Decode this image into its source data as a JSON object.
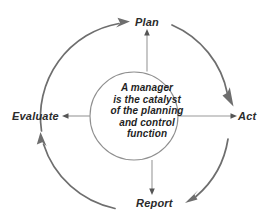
{
  "diagram": {
    "background_color": "#ffffff",
    "arc_color": "#6e6e6e",
    "spoke_color": "#9a9a9a",
    "label_color": "#2b2b2b",
    "center": {
      "lines": [
        "A manager",
        "is the catalyst",
        "of the planning",
        "and control",
        "function"
      ],
      "full_text": "A manager is the catalyst of the planning and control function"
    },
    "nodes": [
      {
        "id": "plan",
        "label": "Plan",
        "position": "top"
      },
      {
        "id": "act",
        "label": "Act",
        "position": "right"
      },
      {
        "id": "report",
        "label": "Report",
        "position": "bottom"
      },
      {
        "id": "evaluate",
        "label": "Evaluate",
        "position": "left"
      }
    ],
    "flow_order": [
      "Plan",
      "Act",
      "Report",
      "Evaluate"
    ],
    "arcs": [
      {
        "id": "arc-plan-to-act",
        "from": "Plan",
        "to": "Act",
        "direction": "clockwise"
      },
      {
        "id": "arc-act-to-report",
        "from": "Act",
        "to": "Report",
        "direction": "clockwise"
      },
      {
        "id": "arc-report-to-evaluate",
        "from": "Report",
        "to": "Evaluate",
        "direction": "clockwise"
      },
      {
        "id": "arc-evaluate-to-plan",
        "from": "Evaluate",
        "to": "Plan",
        "direction": "clockwise"
      }
    ],
    "spokes": [
      {
        "id": "spoke-center-to-plan",
        "to": "Plan"
      },
      {
        "id": "spoke-center-to-act",
        "to": "Act"
      },
      {
        "id": "spoke-center-to-report",
        "to": "Report"
      },
      {
        "id": "spoke-center-to-evaluate",
        "to": "Evaluate"
      }
    ]
  }
}
